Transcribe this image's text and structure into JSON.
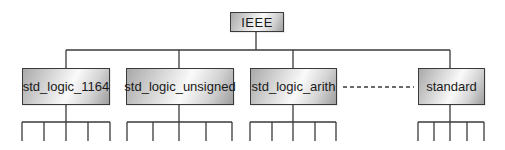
{
  "diagram": {
    "type": "hierarchy",
    "root": {
      "label": "IEEE"
    },
    "children": [
      {
        "label": "std_logic_1164",
        "leaf_count": 5
      },
      {
        "label": "std_logic_unsigned",
        "leaf_count": 5
      },
      {
        "label": "std_logic_arith",
        "leaf_count": 5
      },
      {
        "label": "standard",
        "leaf_count": 5
      }
    ],
    "ellipsis_connector": {
      "style": "dashed",
      "between": [
        "std_logic_arith",
        "standard"
      ]
    },
    "colors": {
      "line": "#3a3a3a",
      "box_border": "#3a3a3a",
      "box_gradient_dark": "#a0a0a0",
      "box_gradient_light": "#fafafa",
      "text": "#1a1a1a",
      "background": "#ffffff"
    }
  }
}
